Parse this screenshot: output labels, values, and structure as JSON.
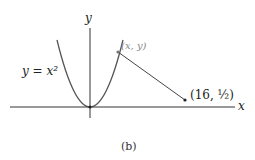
{
  "figure": {
    "caption": "(b)",
    "axis_x_label": "x",
    "axis_y_label": "y",
    "curve_label": "y = x²",
    "point_general_label": "(x, y)",
    "point_fixed_label": "(16, ½)",
    "colors": {
      "curve": "#555555",
      "axis": "#333333",
      "point_general": "#888888"
    }
  }
}
